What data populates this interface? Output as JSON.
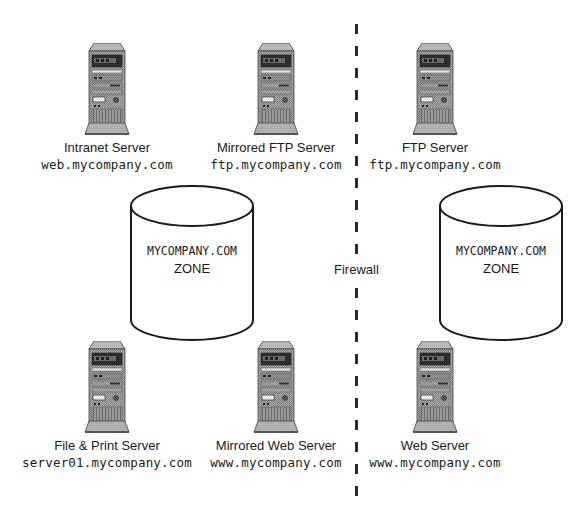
{
  "diagram": {
    "servers": [
      {
        "id": "intranet",
        "label": "Intranet Server",
        "domain": "web.mycompany.com",
        "icon": "server-tower-icon"
      },
      {
        "id": "mirrored-ftp",
        "label": "Mirrored FTP Server",
        "domain": "ftp.mycompany.com",
        "icon": "server-tower-icon"
      },
      {
        "id": "ftp",
        "label": "FTP Server",
        "domain": "ftp.mycompany.com",
        "icon": "server-tower-icon"
      },
      {
        "id": "file-print",
        "label": "File & Print Server",
        "domain": "server01.mycompany.com",
        "icon": "server-tower-icon"
      },
      {
        "id": "mirrored-web",
        "label": "Mirrored Web Server",
        "domain": "www.mycompany.com",
        "icon": "server-tower-icon"
      },
      {
        "id": "web",
        "label": "Web Server",
        "domain": "www.mycompany.com",
        "icon": "server-tower-icon"
      }
    ],
    "zones": [
      {
        "id": "internal-zone",
        "line1": "MYCOMPANY.COM",
        "line2": "ZONE",
        "icon": "database-cylinder-icon"
      },
      {
        "id": "external-zone",
        "line1": "MYCOMPANY.COM",
        "line2": "ZONE",
        "icon": "database-cylinder-icon"
      }
    ],
    "firewall": {
      "label": "Firewall",
      "style": "dashed-vertical-line"
    }
  },
  "colors": {
    "line": "#1a1a1a",
    "server_body": "#9a9a9a",
    "server_dark": "#3a3a3a",
    "background": "#ffffff"
  }
}
